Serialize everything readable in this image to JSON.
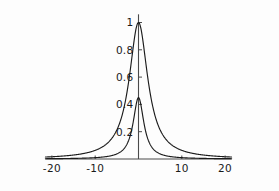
{
  "chart_data": {
    "type": "line",
    "title": "",
    "subtitle": "",
    "xlabel": "",
    "ylabel": "",
    "xlim": [
      -21.5,
      21.5
    ],
    "ylim": [
      0,
      1.06
    ],
    "grid": false,
    "legend": null,
    "legend_position": "none",
    "xticks": [
      -20,
      -10,
      10,
      20
    ],
    "xtick_labels": [
      "-20",
      "-10",
      "10",
      "20"
    ],
    "yticks": [
      0.2,
      0.4,
      0.6,
      0.8,
      1
    ],
    "ytick_labels": [
      "0.2",
      "0.4",
      "0.6",
      "0.8",
      "1"
    ],
    "annotations": [],
    "series": [
      {
        "name": "broad-peak",
        "peak_x": 0,
        "peak_y": 1.0,
        "half_width": 2.6,
        "shape": "lorentzian",
        "x": [
          -21.5,
          -20,
          -18,
          -16,
          -14,
          -12,
          -10,
          -9,
          -8,
          -7,
          -6,
          -5,
          -4.5,
          -4,
          -3.5,
          -3,
          -2.6,
          -2.2,
          -1.8,
          -1.4,
          -1,
          -0.6,
          -0.3,
          0,
          0.3,
          0.6,
          1,
          1.4,
          1.8,
          2.2,
          2.6,
          3,
          3.5,
          4,
          4.5,
          5,
          6,
          7,
          8,
          9,
          10,
          12,
          14,
          16,
          18,
          20,
          21.5
        ],
        "y": [
          0.0145,
          0.0167,
          0.0205,
          0.0257,
          0.0333,
          0.045,
          0.0633,
          0.0769,
          0.0955,
          0.1214,
          0.158,
          0.2126,
          0.2502,
          0.2729,
          0.3578,
          0.4289,
          0.5,
          0.5828,
          0.6758,
          0.7753,
          0.8711,
          0.9492,
          0.9878,
          1.0,
          0.9878,
          0.9492,
          0.8711,
          0.7753,
          0.6758,
          0.5828,
          0.5,
          0.4289,
          0.3578,
          0.2729,
          0.2502,
          0.2126,
          0.158,
          0.1214,
          0.0955,
          0.0769,
          0.0633,
          0.045,
          0.0333,
          0.0257,
          0.0205,
          0.0167,
          0.0145
        ]
      },
      {
        "name": "narrow-peak",
        "peak_x": 0,
        "peak_y": 0.45,
        "half_width": 1.5,
        "shape": "lorentzian",
        "x": [
          -21.5,
          -20,
          -18,
          -16,
          -14,
          -12,
          -10,
          -9,
          -8,
          -7,
          -6,
          -5,
          -4,
          -3.5,
          -3,
          -2.5,
          -2,
          -1.6,
          -1.2,
          -0.9,
          -0.6,
          -0.3,
          0,
          0.3,
          0.6,
          0.9,
          1.2,
          1.6,
          2,
          2.5,
          3,
          3.5,
          4,
          5,
          6,
          7,
          8,
          9,
          10,
          12,
          14,
          16,
          18,
          20,
          21.5
        ],
        "y": [
          0.0022,
          0.0025,
          0.0031,
          0.0039,
          0.0051,
          0.0069,
          0.01,
          0.0123,
          0.0156,
          0.0203,
          0.0276,
          0.0394,
          0.0597,
          0.0755,
          0.098,
          0.1309,
          0.18,
          0.2292,
          0.294,
          0.342,
          0.3857,
          0.4276,
          0.45,
          0.4276,
          0.3857,
          0.342,
          0.294,
          0.2292,
          0.18,
          0.1309,
          0.098,
          0.0755,
          0.0597,
          0.0394,
          0.0276,
          0.0203,
          0.0156,
          0.0123,
          0.01,
          0.0069,
          0.0051,
          0.0039,
          0.0031,
          0.0025,
          0.0022
        ]
      }
    ],
    "colors": {
      "curve": "#1c1c1c",
      "axis": "#4a4a4a",
      "background": "#fdfdfd",
      "text": "#1a1a1a"
    }
  }
}
